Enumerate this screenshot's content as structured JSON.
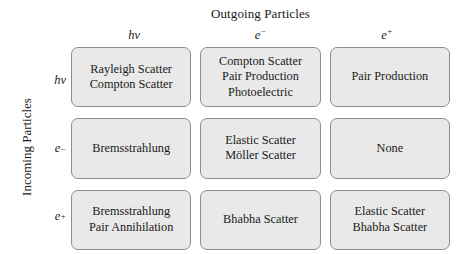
{
  "axes": {
    "outgoing_title": "Outgoing Particles",
    "incoming_title": "Incoming Particles"
  },
  "columns": [
    {
      "base": "hν",
      "sup": ""
    },
    {
      "base": "e",
      "sup": "−"
    },
    {
      "base": "e",
      "sup": "+"
    }
  ],
  "rows": [
    {
      "base": "hν",
      "sup": ""
    },
    {
      "base": "e",
      "sup": "−"
    },
    {
      "base": "e",
      "sup": "+"
    }
  ],
  "matrix": [
    [
      {
        "lines": [
          "Rayleigh Scatter",
          "Compton Scatter"
        ]
      },
      {
        "lines": [
          "Compton Scatter",
          "Pair Production",
          "Photoelectric"
        ]
      },
      {
        "lines": [
          "Pair Production"
        ]
      }
    ],
    [
      {
        "lines": [
          "Bremsstrahlung"
        ]
      },
      {
        "lines": [
          "Elastic Scatter",
          "Möller Scatter"
        ]
      },
      {
        "lines": [
          "None"
        ]
      }
    ],
    [
      {
        "lines": [
          "Bremsstrahlung",
          "Pair Annihilation"
        ]
      },
      {
        "lines": [
          "Bhabha Scatter"
        ]
      },
      {
        "lines": [
          "Elastic Scatter",
          "Bhabha Scatter"
        ]
      }
    ]
  ],
  "colors": {
    "cell_fill": "#e9e9e9",
    "cell_border": "#8d8d8d",
    "text": "#1a1a1a",
    "background": "#ffffff"
  }
}
